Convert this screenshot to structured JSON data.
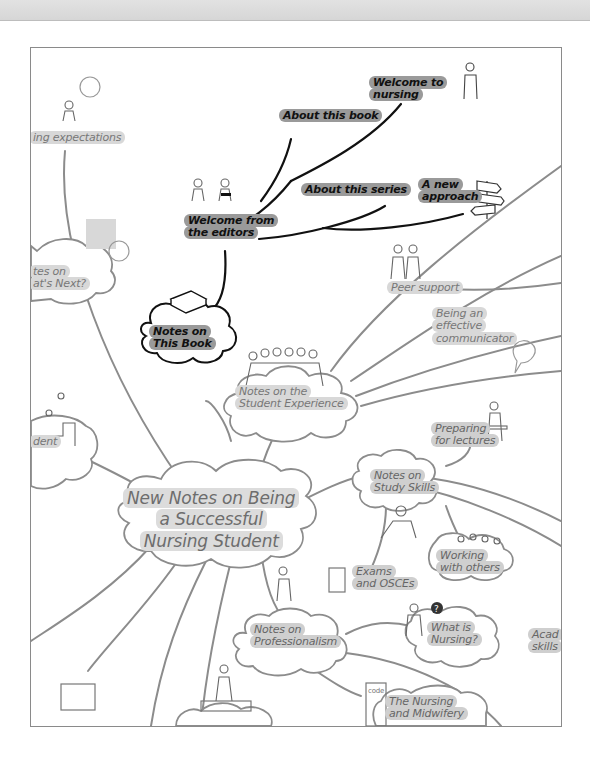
{
  "map": {
    "title": "New Notes on Being a Successful Nursing Student",
    "title_lines": [
      "New Notes on Being",
      "a Successful",
      "Nursing Student"
    ],
    "nodes": {
      "notes_this_book": {
        "lines": [
          "Notes on",
          "This Book"
        ]
      },
      "welcome_editors": {
        "lines": [
          "Welcome from",
          "the editors"
        ]
      },
      "about_book": {
        "label": "About this book"
      },
      "welcome_nursing": {
        "lines": [
          "Welcome to",
          "nursing"
        ]
      },
      "about_series": {
        "label": "About this series"
      },
      "new_approach": {
        "lines": [
          "A new",
          "approach"
        ]
      },
      "expectations": {
        "label": "ing expectations"
      },
      "whats_next": {
        "lines": [
          "tes on",
          "at's Next?"
        ]
      },
      "student_exp": {
        "lines": [
          "Notes on the",
          "Student Experience"
        ]
      },
      "peer_support": {
        "label": "Peer support"
      },
      "communicator": {
        "lines": [
          "Being an",
          "effective",
          "communicator"
        ]
      },
      "student_left": {
        "label": "dent"
      },
      "preparing": {
        "lines": [
          "Preparing",
          "for lectures"
        ]
      },
      "study_skills": {
        "lines": [
          "Notes on",
          "Study Skills"
        ]
      },
      "working": {
        "lines": [
          "Working",
          "with others"
        ]
      },
      "exams": {
        "lines": [
          "Exams",
          "and OSCEs"
        ]
      },
      "professionalism": {
        "lines": [
          "Notes on",
          "Professionalism"
        ]
      },
      "what_is": {
        "lines": [
          "What is",
          "Nursing?"
        ]
      },
      "academic": {
        "lines": [
          "Acad",
          "skills"
        ]
      },
      "nmc": {
        "lines": [
          "The Nursing",
          "and Midwifery"
        ]
      },
      "code_book": {
        "label": "code"
      }
    }
  },
  "colors": {
    "frame_border": "#8a8a8a",
    "dark_branch": "#111111",
    "grey_branch": "#8c8c8c",
    "dark_highlight": "#9a9a9a",
    "light_highlight": "#d8d8d8"
  }
}
